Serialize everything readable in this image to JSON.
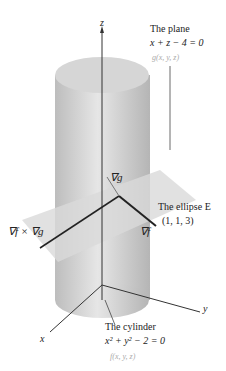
{
  "diagram": {
    "axes": {
      "z": "z",
      "x": "x",
      "y": "y"
    },
    "plane": {
      "title": "The plane",
      "equation": "x + z − 4 = 0",
      "function": "g(x, y, z)"
    },
    "cylinder": {
      "title": "The cylinder",
      "equation": "x² + y² − 2 = 0",
      "function": "f(x, y, z)"
    },
    "ellipse": {
      "label": "The ellipse E",
      "point": "(1, 1, 3)"
    },
    "vectors": {
      "grad_g": "∇g",
      "grad_f": "∇f",
      "cross": "∇f × ∇g"
    },
    "colors": {
      "cylinder": "#c8c8c8",
      "plane": "#d9d9d9",
      "ink": "#222222"
    }
  }
}
